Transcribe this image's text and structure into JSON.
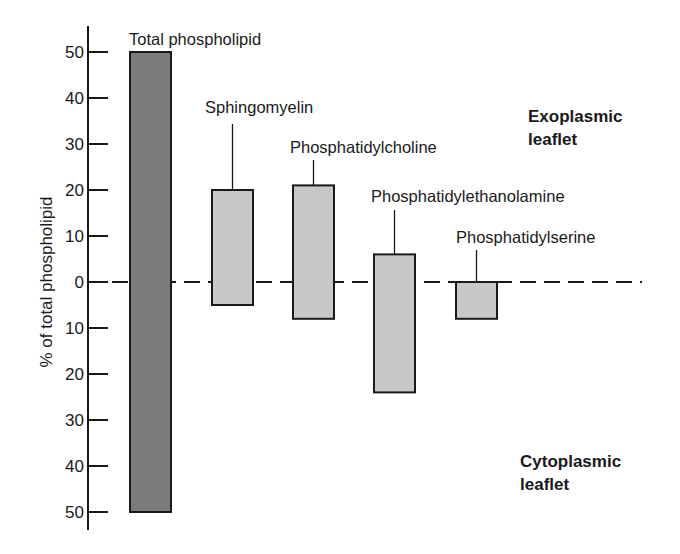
{
  "chart_data": {
    "type": "bar",
    "title": "",
    "ylabel": "% of total phospholipid",
    "xlabel": "",
    "ylim": [
      -50,
      50
    ],
    "y_ticks": [
      50,
      40,
      30,
      20,
      10,
      0,
      10,
      20,
      30,
      40,
      50
    ],
    "y_tick_values": [
      50,
      40,
      30,
      20,
      10,
      0,
      -10,
      -20,
      -30,
      -40,
      -50
    ],
    "grid": false,
    "zero_line": "dashed",
    "categories": [
      "Total phospholipid",
      "Sphingomyelin",
      "Phosphatidylcholine",
      "Phosphatidylethanolamine",
      "Phosphatidylserine"
    ],
    "series": [
      {
        "name": "Exoplasmic leaflet",
        "values": [
          50,
          20,
          21,
          6,
          0
        ]
      },
      {
        "name": "Cytoplasmic leaflet",
        "values": [
          -50,
          -5,
          -8,
          -24,
          -8
        ]
      }
    ],
    "annotations": [
      {
        "text": "Exoplasmic leaflet",
        "region": "above zero"
      },
      {
        "text": "Cytoplasmic leaflet",
        "region": "below zero"
      }
    ],
    "colors": {
      "total_bar": "#7b7b7b",
      "component_bar": "#c8c8c8",
      "outline": "#1a1a1a"
    }
  },
  "labels": {
    "y_axis_title": "% of total phospholipid",
    "exoplasmic_line1": "Exoplasmic",
    "exoplasmic_line2": "leaflet",
    "cytoplasmic_line1": "Cytoplasmic",
    "cytoplasmic_line2": "leaflet",
    "bars": [
      "Total phospholipid",
      "Sphingomyelin",
      "Phosphatidylcholine",
      "Phosphatidylethanolamine",
      "Phosphatidylserine"
    ]
  }
}
